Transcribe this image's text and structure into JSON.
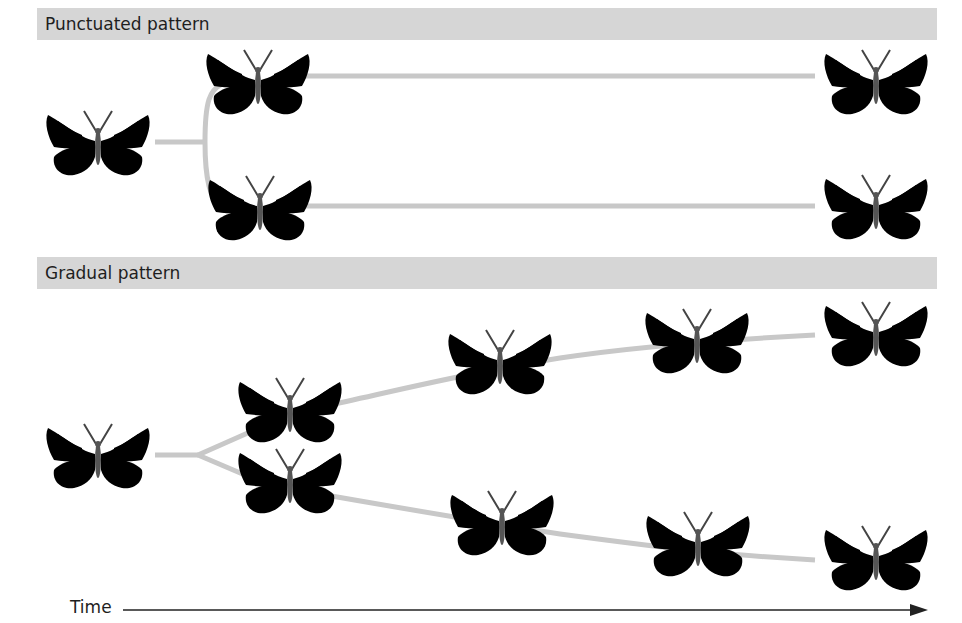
{
  "sections": [
    {
      "title": "Punctuated pattern"
    },
    {
      "title": "Gradual pattern"
    }
  ],
  "axis": {
    "label": "Time",
    "direction": "left-to-right"
  },
  "colors": {
    "header_bg": "#d6d6d6",
    "lineage_line": "#c8c8c8",
    "text": "#1e1e1e",
    "axis": "#222222"
  },
  "punctuated": {
    "ancestor": {
      "x": 98,
      "y": 143,
      "morph": "intermediate"
    },
    "branches": [
      {
        "name": "upper-lineage",
        "nodes": [
          {
            "x": 258,
            "y": 82,
            "morph": "dark-banded"
          },
          {
            "x": 876,
            "y": 82,
            "morph": "dark-banded"
          }
        ]
      },
      {
        "name": "lower-lineage",
        "nodes": [
          {
            "x": 260,
            "y": 207,
            "morph": "pale"
          },
          {
            "x": 876,
            "y": 206,
            "morph": "pale"
          }
        ]
      }
    ]
  },
  "gradual": {
    "ancestor": {
      "x": 98,
      "y": 455,
      "morph": "intermediate"
    },
    "branches": [
      {
        "name": "upper-lineage",
        "nodes": [
          {
            "x": 290,
            "y": 410,
            "morph": "intermediate-dark"
          },
          {
            "x": 500,
            "y": 362,
            "morph": "dark-banded"
          },
          {
            "x": 697,
            "y": 340,
            "morph": "dark-banded"
          },
          {
            "x": 876,
            "y": 333,
            "morph": "dark-banded"
          }
        ]
      },
      {
        "name": "lower-lineage",
        "nodes": [
          {
            "x": 290,
            "y": 480,
            "morph": "intermediate"
          },
          {
            "x": 502,
            "y": 522,
            "morph": "intermediate-pale"
          },
          {
            "x": 698,
            "y": 543,
            "morph": "pale-mid"
          },
          {
            "x": 876,
            "y": 557,
            "morph": "pale"
          }
        ]
      }
    ]
  }
}
